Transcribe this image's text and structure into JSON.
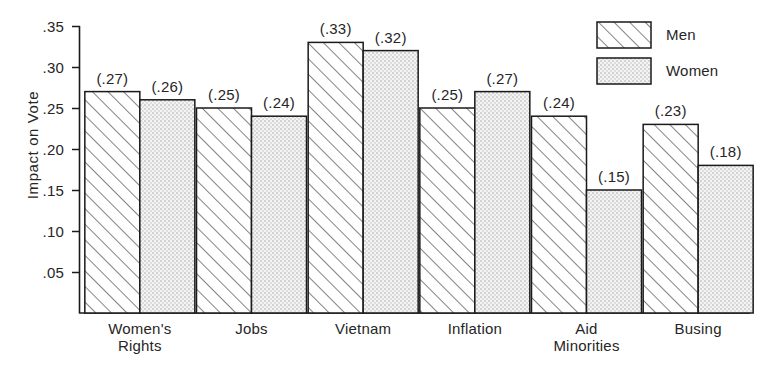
{
  "chart_data": {
    "type": "bar",
    "title": "",
    "xlabel": "",
    "ylabel": "Impact on Vote",
    "ylim": [
      0,
      0.35
    ],
    "yticks": [
      0.35,
      0.3,
      0.25,
      0.2,
      0.15,
      0.1,
      0.05
    ],
    "ytick_labels": [
      ".35",
      ".30",
      ".25",
      ".20",
      ".15",
      ".10",
      ".05"
    ],
    "grid": false,
    "legend_position": "top-right",
    "categories": [
      "Women's Rights",
      "Jobs",
      "Vietnam",
      "Inflation",
      "Aid Minorities",
      "Busing"
    ],
    "category_lines": [
      [
        "Women's",
        "Rights"
      ],
      [
        "Jobs"
      ],
      [
        "Vietnam"
      ],
      [
        "Inflation"
      ],
      [
        "Aid",
        "Minorities"
      ],
      [
        "Busing"
      ]
    ],
    "series": [
      {
        "name": "Men",
        "fill": "diagonal-hatch",
        "values": [
          0.27,
          0.25,
          0.33,
          0.25,
          0.24,
          0.23
        ],
        "value_labels": [
          "(.27)",
          "(.25)",
          "(.33)",
          "(.25)",
          "(.24)",
          "(.23)"
        ]
      },
      {
        "name": "Women",
        "fill": "stipple-dots",
        "values": [
          0.26,
          0.24,
          0.32,
          0.27,
          0.15,
          0.18
        ],
        "value_labels": [
          "(.26)",
          "(.24)",
          "(.32)",
          "(.27)",
          "(.15)",
          "(.18)"
        ]
      }
    ]
  },
  "legend": {
    "entries": [
      {
        "label": "Men",
        "swatch": "diagonal-hatch-swatch"
      },
      {
        "label": "Women",
        "swatch": "stipple-dots-swatch"
      }
    ]
  },
  "colors": {
    "ink": "#262626",
    "axis": "#1a1a1a",
    "hatch": "#3a3a3a",
    "stipple": "#8c8c8c",
    "stipple_bg": "#f2f2f2",
    "background": "#ffffff",
    "caption_ghost": "#c9c9c9"
  },
  "caption": {
    "text": ""
  }
}
